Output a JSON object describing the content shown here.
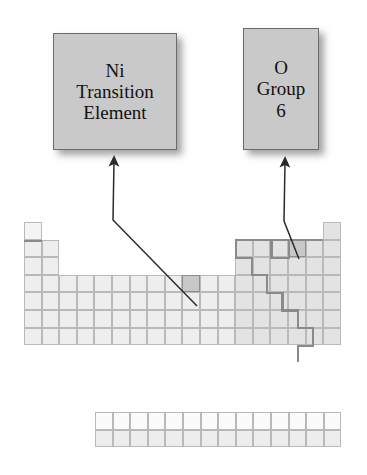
{
  "figure": {
    "background": "#ffffff"
  },
  "callouts": [
    {
      "id": "ni",
      "lines": [
        "Ni",
        "Transition",
        "Element"
      ],
      "points_to": "nickel-cell",
      "box": {
        "x": 53,
        "y": 33,
        "w": 124,
        "h": 117
      },
      "fill": "#c9c9c9",
      "border": "#6b6b6b"
    },
    {
      "id": "o",
      "lines": [
        "O",
        "Group",
        "6"
      ],
      "points_to": "oxygen-cell",
      "box": {
        "x": 243,
        "y": 28,
        "w": 76,
        "h": 122
      },
      "fill": "#c9c9c9",
      "border": "#6b6b6b"
    }
  ],
  "leaders": [
    {
      "id": "ni-leader",
      "points": "114,161 113,220 197,306",
      "arrow_at": "114,161",
      "color": "#2b2b2b"
    },
    {
      "id": "o-leader",
      "points": "285,162 284,221 299,259",
      "arrow_at": "285,162",
      "color": "#2b2b2b"
    }
  ],
  "table": {
    "origin": {
      "x": 24,
      "y": 222
    },
    "cell": {
      "w": 17.6,
      "h": 17.6
    },
    "columns": 18,
    "rows": 7,
    "colors": {
      "grid_line": "#b9b9b9",
      "cell_fill": "#eeeeee",
      "cell_fill_pale": "#f4f4f4",
      "cell_fill_shaded": "#e3e3e3",
      "highlight_fill": "#c8c8c8",
      "highlight_border": "#8d8d8d",
      "heavy_line": "#8a8a8a"
    },
    "occupancy": [
      [
        1,
        0,
        0,
        0,
        0,
        0,
        0,
        0,
        0,
        0,
        0,
        0,
        0,
        0,
        0,
        0,
        0,
        1
      ],
      [
        1,
        1,
        0,
        0,
        0,
        0,
        0,
        0,
        0,
        0,
        0,
        0,
        1,
        1,
        1,
        1,
        1,
        1
      ],
      [
        1,
        1,
        0,
        0,
        0,
        0,
        0,
        0,
        0,
        0,
        0,
        0,
        1,
        1,
        1,
        1,
        1,
        1
      ],
      [
        1,
        1,
        1,
        1,
        1,
        1,
        1,
        1,
        1,
        1,
        1,
        1,
        1,
        1,
        1,
        1,
        1,
        1
      ],
      [
        1,
        1,
        1,
        1,
        1,
        1,
        1,
        1,
        1,
        1,
        1,
        1,
        1,
        1,
        1,
        1,
        1,
        1
      ],
      [
        1,
        1,
        1,
        1,
        1,
        1,
        1,
        1,
        1,
        1,
        1,
        1,
        1,
        1,
        1,
        1,
        1,
        1
      ],
      [
        1,
        1,
        1,
        1,
        1,
        1,
        1,
        1,
        1,
        1,
        1,
        1,
        1,
        1,
        1,
        1,
        1,
        1
      ]
    ],
    "shaded_columns_from": 13,
    "highlighted_cells": [
      {
        "name": "nickel-cell",
        "symbol": "Ni",
        "row": 4,
        "column": 10
      },
      {
        "name": "oxygen-cell",
        "symbol": "O",
        "row": 2,
        "column": 16
      }
    ],
    "heavy_segments": [
      {
        "name": "hydrogen-underline",
        "x": 24,
        "y": 239.6,
        "w": 17.6,
        "h": 2.2
      },
      {
        "name": "nonmetal-outline-top",
        "x": 235.2,
        "y": 239.0,
        "w": 88.0,
        "h": 2.2
      },
      {
        "name": "nonmetal-outline-left-b",
        "x": 235.2,
        "y": 239.0,
        "w": 2.2,
        "h": 17.6
      },
      {
        "name": "staircase-h1",
        "x": 235.2,
        "y": 256.6,
        "w": 17.6,
        "h": 2.2
      },
      {
        "name": "staircase-v1",
        "x": 250.6,
        "y": 256.6,
        "w": 2.2,
        "h": 17.6
      },
      {
        "name": "staircase-h2",
        "x": 250.6,
        "y": 274.2,
        "w": 17.6,
        "h": 2.2
      },
      {
        "name": "staircase-v2",
        "x": 266.0,
        "y": 274.2,
        "w": 2.2,
        "h": 17.6
      },
      {
        "name": "staircase-h3",
        "x": 266.0,
        "y": 291.8,
        "w": 17.6,
        "h": 2.2
      },
      {
        "name": "staircase-v3",
        "x": 281.4,
        "y": 291.8,
        "w": 2.2,
        "h": 17.6
      },
      {
        "name": "staircase-h4",
        "x": 281.4,
        "y": 309.4,
        "w": 17.6,
        "h": 2.2
      },
      {
        "name": "staircase-v4",
        "x": 296.8,
        "y": 309.4,
        "w": 2.2,
        "h": 17.6
      },
      {
        "name": "staircase-h5",
        "x": 296.8,
        "y": 327.0,
        "w": 17.6,
        "h": 2.2
      },
      {
        "name": "staircase-v5",
        "x": 312.2,
        "y": 327.0,
        "w": 2.2,
        "h": 17.6
      },
      {
        "name": "staircase-h6",
        "x": 296.8,
        "y": 344.6,
        "w": 17.6,
        "h": 2.2
      },
      {
        "name": "staircase-v6",
        "x": 296.8,
        "y": 344.6,
        "w": 2.2,
        "h": 17.6
      },
      {
        "name": "oxygen-box-right",
        "x": 288.0,
        "y": 239.0,
        "w": 2.2,
        "h": 19.8
      },
      {
        "name": "oxygen-box-left",
        "x": 270.4,
        "y": 239.0,
        "w": 2.2,
        "h": 19.8
      },
      {
        "name": "oxygen-box-bottom",
        "x": 270.4,
        "y": 256.8,
        "w": 19.8,
        "h": 2.2
      }
    ]
  },
  "f_block": {
    "origin": {
      "x": 95,
      "y": 412
    },
    "cell": {
      "w": 17.6,
      "h": 17.6
    },
    "columns": 14,
    "rows": 2,
    "row_fills": [
      "#fbfbfb",
      "#ededed"
    ]
  }
}
